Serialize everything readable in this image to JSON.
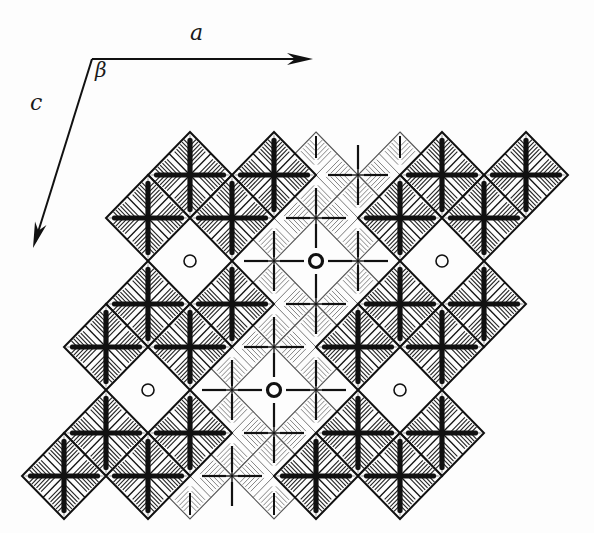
{
  "figure": {
    "width": 594,
    "height": 533,
    "colors": {
      "ink": "#111111",
      "light_ink": "#555555",
      "background": "#fdfdfd"
    }
  },
  "axes": {
    "origin": [
      92,
      59
    ],
    "a": {
      "label": "a",
      "tip": [
        313,
        59
      ],
      "label_pos": [
        190,
        22
      ]
    },
    "c": {
      "label": "c",
      "tip": [
        33,
        248
      ],
      "label_pos": [
        30,
        92
      ]
    },
    "angle": {
      "label": "β",
      "label_pos": [
        95,
        60
      ]
    }
  },
  "lattice": {
    "x0": 190,
    "y0": 175,
    "dx": 42,
    "dy": 43,
    "half_w": 42,
    "half_h": 43
  },
  "dark_octahedra": [
    [
      0,
      0
    ],
    [
      2,
      0
    ],
    [
      6,
      0
    ],
    [
      8,
      0
    ],
    [
      -1,
      1
    ],
    [
      1,
      1
    ],
    [
      5,
      1
    ],
    [
      7,
      1
    ],
    [
      -1,
      3
    ],
    [
      1,
      3
    ],
    [
      5,
      3
    ],
    [
      7,
      3
    ],
    [
      -2,
      4
    ],
    [
      0,
      4
    ],
    [
      4,
      4
    ],
    [
      6,
      4
    ],
    [
      -2,
      6
    ],
    [
      0,
      6
    ],
    [
      4,
      6
    ],
    [
      6,
      6
    ],
    [
      -3,
      7
    ],
    [
      -1,
      7
    ],
    [
      3,
      7
    ],
    [
      5,
      7
    ]
  ],
  "light_octahedra": [
    [
      3,
      0
    ],
    [
      5,
      0
    ],
    [
      2,
      1
    ],
    [
      4,
      1
    ],
    [
      2,
      3
    ],
    [
      4,
      3
    ],
    [
      1,
      4
    ],
    [
      3,
      4
    ],
    [
      1,
      6
    ],
    [
      3,
      6
    ],
    [
      0,
      7
    ],
    [
      2,
      7
    ]
  ],
  "light_axis_crosses": [
    [
      4,
      0
    ],
    [
      3,
      1
    ],
    [
      2,
      2
    ],
    [
      4,
      2
    ],
    [
      3,
      3
    ],
    [
      2,
      4
    ],
    [
      1,
      5
    ],
    [
      3,
      5
    ],
    [
      2,
      6
    ],
    [
      1,
      7
    ]
  ],
  "holes": [
    {
      "pos": [
        0,
        2
      ],
      "style": "thin"
    },
    {
      "pos": [
        6,
        2
      ],
      "style": "thin"
    },
    {
      "pos": [
        -1,
        5
      ],
      "style": "thin"
    },
    {
      "pos": [
        5,
        5
      ],
      "style": "thin"
    },
    {
      "pos": [
        3,
        2
      ],
      "style": "bold"
    },
    {
      "pos": [
        2,
        5
      ],
      "style": "bold"
    }
  ]
}
